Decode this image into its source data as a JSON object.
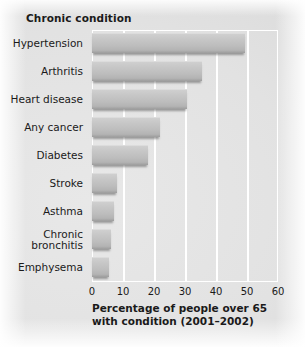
{
  "header": {
    "category_header": "Chronic condition"
  },
  "axis_title": {
    "line1": "Percentage of people over 65",
    "line2": "with condition (2001–2002)"
  },
  "colors": {
    "bar_fill": "#c3c3c3",
    "bar_shadow": "#8f8f8f",
    "gridline": "#ffffff",
    "background": "#e2e2e2",
    "text": "#1a1a1a"
  },
  "chart_data": {
    "type": "bar",
    "orientation": "horizontal",
    "title": "",
    "xlabel": "Percentage of people over 65 with condition (2001–2002)",
    "ylabel": "Chronic condition",
    "xlim": [
      0,
      60
    ],
    "xticks": [
      0,
      10,
      20,
      30,
      40,
      50,
      60
    ],
    "xtick_labels": [
      "0",
      "10",
      "20",
      "30",
      "40",
      "50",
      "60"
    ],
    "grid": true,
    "grid_axis": "x",
    "legend": false,
    "categories": [
      "Hypertension",
      "Arthritis",
      "Heart disease",
      "Any cancer",
      "Diabetes",
      "Stroke",
      "Asthma",
      "Chronic bronchitis",
      "Emphysema"
    ],
    "category_lines": [
      [
        "Hypertension"
      ],
      [
        "Arthritis"
      ],
      [
        "Heart disease"
      ],
      [
        "Any cancer"
      ],
      [
        "Diabetes"
      ],
      [
        "Stroke"
      ],
      [
        "Asthma"
      ],
      [
        "Chronic",
        "bronchitis"
      ],
      [
        "Emphysema"
      ]
    ],
    "values": [
      49.5,
      35.5,
      30.5,
      22,
      18,
      8,
      7,
      6,
      5.5
    ]
  }
}
